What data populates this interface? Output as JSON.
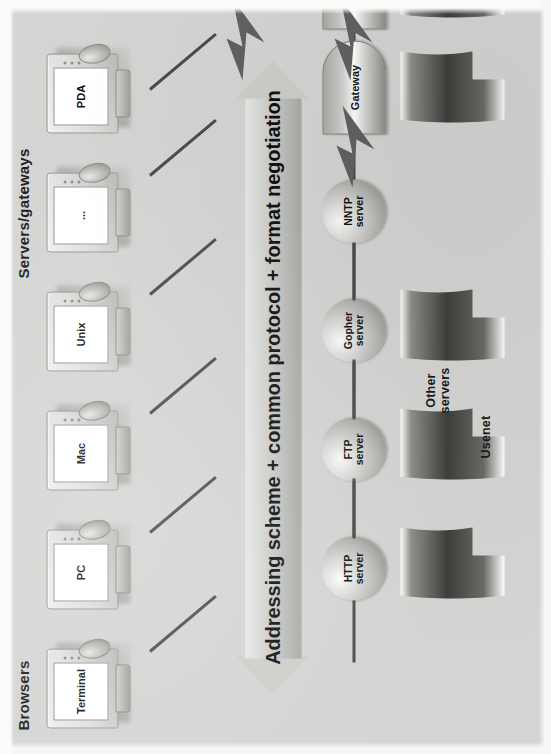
{
  "diagram": {
    "orientation": "rotated-90-ccw",
    "background_color": "#d4d4d2",
    "ink_color": "#1b1b1b",
    "wire_color": "#4b4b4b",
    "sections": {
      "left_label": "Browsers",
      "right_label": "Servers/gateways"
    },
    "center_arrow": {
      "text": "Addressing scheme + common protocol + format negotiation",
      "style": "double-headed"
    },
    "clients": [
      {
        "label": "Terminal",
        "icon": "monitor-icon"
      },
      {
        "label": "PC",
        "icon": "monitor-icon"
      },
      {
        "label": "Mac",
        "icon": "monitor-icon"
      },
      {
        "label": "Unix",
        "icon": "monitor-icon"
      },
      {
        "label": "...",
        "icon": "monitor-icon"
      },
      {
        "label": "PDA",
        "icon": "monitor-icon"
      }
    ],
    "servers": [
      {
        "label": "HTTP\nserver",
        "line1": "HTTP",
        "line2": "server",
        "shape": "sphere"
      },
      {
        "label": "FTP\nserver",
        "line1": "FTP",
        "line2": "server",
        "shape": "sphere"
      },
      {
        "label": "Gopher\nserver",
        "line1": "Gopher",
        "line2": "server",
        "shape": "sphere"
      },
      {
        "label": "NNTP\nserver",
        "line1": "NNTP",
        "line2": "server",
        "shape": "sphere"
      },
      {
        "label": "Gateway",
        "line1": "Gateway",
        "line2": "",
        "shape": "capsule"
      },
      {
        "label": "Gateway",
        "line1": "Gateway",
        "line2": "",
        "shape": "capsule"
      }
    ],
    "annotations": [
      {
        "name": "usenet",
        "text": "Usenet"
      },
      {
        "name": "other-servers",
        "line1": "Other",
        "line2": "servers"
      }
    ]
  }
}
